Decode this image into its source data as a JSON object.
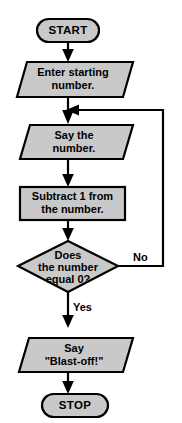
{
  "diagram": {
    "type": "flowchart",
    "canvas": {
      "width": 182,
      "height": 423
    },
    "colors": {
      "shape_fill": "#c9c9c9",
      "shape_stroke": "#000000",
      "connector": "#000000",
      "text": "#000000",
      "background": "#ffffff"
    },
    "nodes": [
      {
        "id": "start",
        "shape": "terminator",
        "label": "START",
        "lines": [
          "START"
        ]
      },
      {
        "id": "enter-number",
        "shape": "parallelogram",
        "label": "Enter starting number.",
        "lines": [
          "Enter starting",
          "number."
        ]
      },
      {
        "id": "say-number",
        "shape": "parallelogram",
        "label": "Say the number.",
        "lines": [
          "Say the",
          "number."
        ]
      },
      {
        "id": "subtract-one",
        "shape": "rectangle",
        "label": "Subtract 1 from the number.",
        "lines": [
          "Subtract 1 from",
          "the number."
        ]
      },
      {
        "id": "decision",
        "shape": "diamond",
        "label": "Does the number equal 0?",
        "lines": [
          "Does",
          "the number",
          "equal 0?"
        ]
      },
      {
        "id": "blast-off",
        "shape": "parallelogram",
        "label": "Say \"Blast-off!\"",
        "lines": [
          "Say",
          "\"Blast-off!\""
        ]
      },
      {
        "id": "stop",
        "shape": "terminator",
        "label": "STOP",
        "lines": [
          "STOP"
        ]
      }
    ],
    "branch_labels": {
      "no": "No",
      "yes": "Yes"
    },
    "edges": [
      {
        "from": "start",
        "to": "enter-number",
        "label": ""
      },
      {
        "from": "enter-number",
        "to": "say-number",
        "label": ""
      },
      {
        "from": "say-number",
        "to": "subtract-one",
        "label": ""
      },
      {
        "from": "subtract-one",
        "to": "decision",
        "label": ""
      },
      {
        "from": "decision",
        "to": "say-number",
        "label": "No"
      },
      {
        "from": "decision",
        "to": "blast-off",
        "label": "Yes"
      },
      {
        "from": "blast-off",
        "to": "stop",
        "label": ""
      }
    ]
  }
}
